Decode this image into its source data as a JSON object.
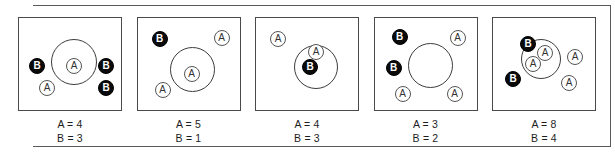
{
  "figure": {
    "token_labels": {
      "a": "A",
      "b": "B"
    },
    "panels": [
      {
        "id": "panel-1",
        "caption_a": "A = 4",
        "caption_b": "B = 3",
        "circle": {
          "left": 32,
          "top": 21,
          "size": 46
        },
        "tokens": [
          {
            "label": "A",
            "type": "a",
            "left": 47,
            "top": 40,
            "inside": true
          },
          {
            "label": "B",
            "type": "b",
            "left": 10,
            "top": 40,
            "inside": false
          },
          {
            "label": "B",
            "type": "b",
            "left": 79,
            "top": 40,
            "inside": false
          },
          {
            "label": "B",
            "type": "b",
            "left": 79,
            "top": 62,
            "inside": false
          },
          {
            "label": "A",
            "type": "a",
            "left": 20,
            "top": 62,
            "inside": false
          }
        ]
      },
      {
        "id": "panel-2",
        "caption_a": "A = 5",
        "caption_b": "B = 1",
        "circle": {
          "left": 32,
          "top": 29,
          "size": 45
        },
        "tokens": [
          {
            "label": "A",
            "type": "a",
            "left": 46,
            "top": 48,
            "inside": true
          },
          {
            "label": "B",
            "type": "b",
            "left": 14,
            "top": 13,
            "inside": false
          },
          {
            "label": "A",
            "type": "a",
            "left": 76,
            "top": 12,
            "inside": false
          },
          {
            "label": "A",
            "type": "a",
            "left": 17,
            "top": 64,
            "inside": false
          }
        ]
      },
      {
        "id": "panel-3",
        "caption_a": "A = 4",
        "caption_b": "B = 3",
        "circle": {
          "left": 38,
          "top": 27,
          "size": 44
        },
        "tokens": [
          {
            "label": "A",
            "type": "a",
            "left": 52,
            "top": 26,
            "inside": true
          },
          {
            "label": "B",
            "type": "b",
            "left": 46,
            "top": 41,
            "inside": true
          },
          {
            "label": "A",
            "type": "a",
            "left": 14,
            "top": 13,
            "inside": false
          }
        ]
      },
      {
        "id": "panel-4",
        "caption_a": "A = 3",
        "caption_b": "B = 2",
        "circle": {
          "left": 33,
          "top": 25,
          "size": 45
        },
        "tokens": [
          {
            "label": "B",
            "type": "b",
            "left": 17,
            "top": 11,
            "inside": false
          },
          {
            "label": "B",
            "type": "b",
            "left": 11,
            "top": 42,
            "inside": false
          },
          {
            "label": "A",
            "type": "a",
            "left": 75,
            "top": 12,
            "inside": false
          },
          {
            "label": "A",
            "type": "a",
            "left": 20,
            "top": 68,
            "inside": false
          },
          {
            "label": "A",
            "type": "a",
            "left": 72,
            "top": 68,
            "inside": false
          }
        ]
      },
      {
        "id": "panel-5",
        "caption_a": "A = 8",
        "caption_b": "B = 4",
        "circle": {
          "left": 28,
          "top": 21,
          "size": 40
        },
        "tokens": [
          {
            "label": "A",
            "type": "a",
            "left": 44,
            "top": 27,
            "inside": true
          },
          {
            "label": "A",
            "type": "a",
            "left": 32,
            "top": 38,
            "inside": true
          },
          {
            "label": "B",
            "type": "b",
            "left": 27,
            "top": 18,
            "inside": false
          },
          {
            "label": "A",
            "type": "a",
            "left": 74,
            "top": 31,
            "inside": false
          },
          {
            "label": "B",
            "type": "b",
            "left": 12,
            "top": 53,
            "inside": false
          },
          {
            "label": "A",
            "type": "a",
            "left": 68,
            "top": 57,
            "inside": false
          }
        ]
      }
    ]
  }
}
